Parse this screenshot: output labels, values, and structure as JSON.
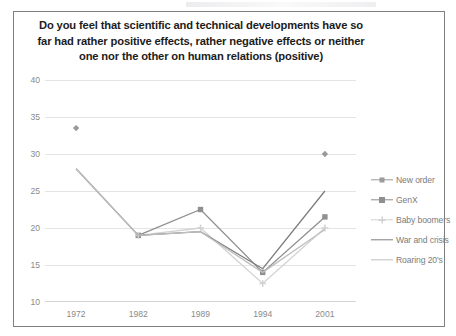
{
  "chart_data": {
    "type": "line",
    "title": "Do you feel that scientific and technical developments have so far had rather positive effects, rather negative effects or neither one nor the other on  human relations (positive)",
    "title_lines": [
      "Do you feel that scientific and technical developments have so",
      "far had rather positive effects, rather negative effects or neither",
      "one nor the other on  human relations (positive)"
    ],
    "xlabel": "",
    "ylabel": "",
    "categories": [
      "1972",
      "1982",
      "1989",
      "1994",
      "2001"
    ],
    "ylim": [
      10,
      40
    ],
    "yticks": [
      "10",
      "15",
      "20",
      "25",
      "30",
      "35",
      "40"
    ],
    "ytick_values": [
      10,
      15,
      20,
      25,
      30,
      35,
      40
    ],
    "grid": true,
    "legend_position": "right",
    "series": [
      {
        "name": "New order",
        "color": "#9a9a9a",
        "marker": "diamond",
        "values": [
          33.5,
          null,
          null,
          null,
          30.0
        ]
      },
      {
        "name": "GenX",
        "color": "#8f8f8f",
        "marker": "square",
        "values": [
          null,
          19.0,
          22.5,
          14.0,
          21.5
        ]
      },
      {
        "name": "Baby boomers",
        "color": "#d2d2d2",
        "marker": "cross",
        "values": [
          null,
          19.0,
          20.0,
          12.5,
          20.0
        ]
      },
      {
        "name": "War and crisis",
        "color": "#7d7d7d",
        "marker": "none",
        "values": [
          28.0,
          19.0,
          19.5,
          14.5,
          25.0
        ]
      },
      {
        "name": "Roaring 20's",
        "color": "#bfbfbf",
        "marker": "none",
        "values": [
          28.0,
          19.0,
          19.5,
          14.0,
          19.8
        ]
      }
    ]
  },
  "colors": {
    "frame_border": "#7f7f7f",
    "gridline": "#e4e4e4",
    "tick_text": "#8a8a8a",
    "title_text": "#1c1c1c",
    "legend_text": "#7b7b7b",
    "background": "#ffffff"
  }
}
